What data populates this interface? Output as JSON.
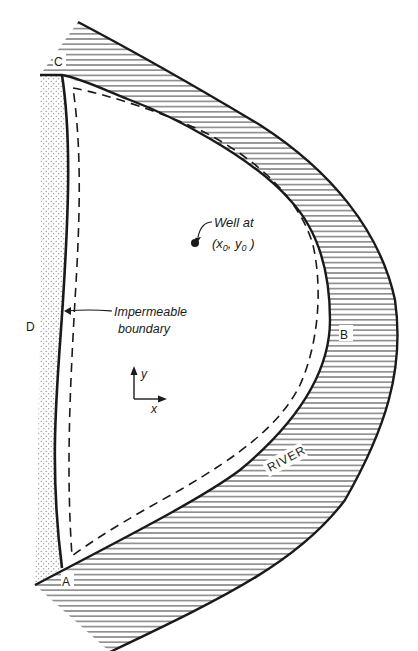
{
  "diagram": {
    "type": "aquifer-plan-view",
    "labels": {
      "corner_a": "A",
      "corner_b": "B",
      "corner_c": "C",
      "corner_d": "D",
      "river": "RIVER",
      "well_line1": "Well at",
      "well_line2_open": "(x",
      "well_sub_x": "0",
      "well_comma": ", y",
      "well_sub_y": "0",
      "well_close": " )",
      "boundary_line1": "Impermeable",
      "boundary_line2": "boundary",
      "axis_y": "y",
      "axis_x": "x"
    },
    "regions": [
      {
        "name": "river",
        "fill": "horizontal-hatching"
      },
      {
        "name": "impermeable-zone",
        "fill": "stippled"
      },
      {
        "name": "aquifer-domain",
        "fill": "white"
      }
    ],
    "colors": {
      "ink": "#1a1a1a",
      "background": "#ffffff"
    }
  }
}
